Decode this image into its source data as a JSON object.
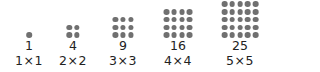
{
  "figure": {
    "dot_color": "#707070",
    "items": [
      {
        "n": 1,
        "value": "1",
        "formula": "1×1"
      },
      {
        "n": 2,
        "value": "4",
        "formula": "2×2"
      },
      {
        "n": 3,
        "value": "9",
        "formula": "3×3"
      },
      {
        "n": 4,
        "value": "16",
        "formula": "4×4"
      },
      {
        "n": 5,
        "value": "25",
        "formula": "5×5"
      }
    ]
  }
}
